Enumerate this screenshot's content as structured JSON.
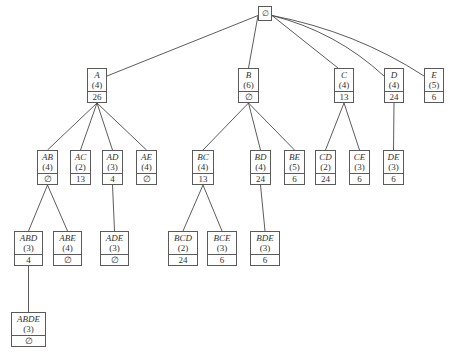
{
  "diagram": {
    "type": "itemset-lattice-tree",
    "root": {
      "id": "root",
      "label": "∅",
      "x": 258,
      "y": 6,
      "w": 14,
      "h": 15
    },
    "nodes": [
      {
        "id": "A",
        "label": "A",
        "support": "(4)",
        "cost": "26",
        "x": 87,
        "y": 68,
        "w": 20,
        "h": 35,
        "parent": "root"
      },
      {
        "id": "B",
        "label": "B",
        "support": "(6)",
        "cost": "∅",
        "x": 238,
        "y": 68,
        "w": 21,
        "h": 35,
        "parent": "root"
      },
      {
        "id": "C",
        "label": "C",
        "support": "(4)",
        "cost": "13",
        "x": 334,
        "y": 68,
        "w": 20,
        "h": 35,
        "parent": "root"
      },
      {
        "id": "D",
        "label": "D",
        "support": "(4)",
        "cost": "24",
        "x": 384,
        "y": 68,
        "w": 20,
        "h": 35,
        "parent": "root"
      },
      {
        "id": "E",
        "label": "E",
        "support": "(5)",
        "cost": "6",
        "x": 424,
        "y": 68,
        "w": 20,
        "h": 35,
        "parent": "root"
      },
      {
        "id": "AB",
        "label": "AB",
        "support": "(4)",
        "cost": "∅",
        "x": 37,
        "y": 150,
        "w": 21,
        "h": 35,
        "parent": "A"
      },
      {
        "id": "AC",
        "label": "AC",
        "support": "(2)",
        "cost": "13",
        "x": 70,
        "y": 150,
        "w": 21,
        "h": 35,
        "parent": "A"
      },
      {
        "id": "AD",
        "label": "AD",
        "support": "(3)",
        "cost": "4",
        "x": 102,
        "y": 150,
        "w": 21,
        "h": 35,
        "parent": "A"
      },
      {
        "id": "AE",
        "label": "AE",
        "support": "(4)",
        "cost": "∅",
        "x": 136,
        "y": 150,
        "w": 21,
        "h": 35,
        "parent": "A"
      },
      {
        "id": "BC",
        "label": "BC",
        "support": "(4)",
        "cost": "13",
        "x": 192,
        "y": 150,
        "w": 22,
        "h": 35,
        "parent": "B"
      },
      {
        "id": "BD",
        "label": "BD",
        "support": "(4)",
        "cost": "24",
        "x": 250,
        "y": 150,
        "w": 21,
        "h": 35,
        "parent": "B"
      },
      {
        "id": "BE",
        "label": "BE",
        "support": "(5)",
        "cost": "6",
        "x": 284,
        "y": 150,
        "w": 21,
        "h": 35,
        "parent": "B"
      },
      {
        "id": "CD",
        "label": "CD",
        "support": "(2)",
        "cost": "24",
        "x": 315,
        "y": 150,
        "w": 21,
        "h": 35,
        "parent": "C"
      },
      {
        "id": "CE",
        "label": "CE",
        "support": "(3)",
        "cost": "6",
        "x": 349,
        "y": 150,
        "w": 21,
        "h": 35,
        "parent": "C"
      },
      {
        "id": "DE",
        "label": "DE",
        "support": "(3)",
        "cost": "6",
        "x": 383,
        "y": 150,
        "w": 21,
        "h": 35,
        "parent": "D"
      },
      {
        "id": "ABD",
        "label": "ABD",
        "support": "(3)",
        "cost": "4",
        "x": 14,
        "y": 231,
        "w": 29,
        "h": 35,
        "parent": "AB"
      },
      {
        "id": "ABE",
        "label": "ABE",
        "support": "(4)",
        "cost": "∅",
        "x": 53,
        "y": 231,
        "w": 29,
        "h": 35,
        "parent": "AB"
      },
      {
        "id": "ADE",
        "label": "ADE",
        "support": "(3)",
        "cost": "∅",
        "x": 100,
        "y": 231,
        "w": 29,
        "h": 35,
        "parent": "AD"
      },
      {
        "id": "BCD",
        "label": "BCD",
        "support": "(2)",
        "cost": "24",
        "x": 168,
        "y": 231,
        "w": 30,
        "h": 35,
        "parent": "BC"
      },
      {
        "id": "BCE",
        "label": "BCE",
        "support": "(3)",
        "cost": "6",
        "x": 207,
        "y": 231,
        "w": 30,
        "h": 35,
        "parent": "BC"
      },
      {
        "id": "BDE",
        "label": "BDE",
        "support": "(3)",
        "cost": "6",
        "x": 250,
        "y": 231,
        "w": 30,
        "h": 35,
        "parent": "BD"
      },
      {
        "id": "ABDE",
        "label": "ABDE",
        "support": "(3)",
        "cost": "∅",
        "x": 11,
        "y": 312,
        "w": 35,
        "h": 35,
        "parent": "ABD"
      }
    ],
    "colors": {
      "line": "#4a4a4a",
      "border": "#5a5a5a",
      "text": "#333333",
      "background": "#ffffff"
    }
  }
}
